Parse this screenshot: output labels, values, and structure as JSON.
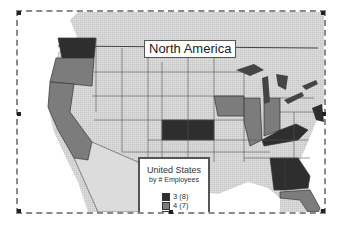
{
  "map": {
    "title": "North America",
    "colors": {
      "class_3": "#2e2e2e",
      "class_4": "#7c7c7c",
      "class_5": "#d2d2d2",
      "water": "#ffffff",
      "canada_mexico": "#dcdcdc",
      "lakes": "#444444"
    },
    "states": {
      "class_3": [
        "Washington",
        "Kansas",
        "Kentucky",
        "Alabama",
        "Georgia",
        "Ohio-area NE (New Jersey/Maryland)"
      ],
      "class_4": [
        "Oregon",
        "California",
        "Iowa",
        "Illinois",
        "Indiana",
        "Florida"
      ]
    }
  },
  "legend": {
    "title_line1": "United States",
    "title_line2": "by # Employees",
    "items": [
      {
        "label": "3  (8)",
        "color": "#2e2e2e"
      },
      {
        "label": "4  (7)",
        "color": "#7c7c7c"
      },
      {
        "label": "5  (4)",
        "color": "#d2d2d2"
      }
    ]
  }
}
